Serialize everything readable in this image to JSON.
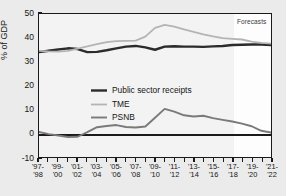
{
  "chart_data": {
    "type": "line",
    "title": "",
    "xlabel": "",
    "ylabel": "% of GDP",
    "ylim": [
      -10,
      50
    ],
    "yticks": [
      -10,
      0,
      10,
      20,
      30,
      40,
      50
    ],
    "grid": false,
    "legend_position": "inside-left",
    "categories": [
      "'97-'98",
      "'98-'99",
      "'99-'00",
      "'00-'01",
      "'01-'02",
      "'02-'03",
      "'03-'04",
      "'04-'05",
      "'05-'06",
      "'06-'07",
      "'07-'08",
      "'08-'09",
      "'09-'10",
      "'10-'11",
      "'11-'12",
      "'12-'13",
      "'13-'14",
      "'14-'15",
      "'15-'16",
      "'16-'17",
      "'17-'18",
      "'18-'19",
      "'19-'20",
      "'20-'21",
      "'21-'22"
    ],
    "x_tick_labels": [
      {
        "top": "'97-",
        "bottom": "'98"
      },
      {
        "top": "'99-",
        "bottom": "'00"
      },
      {
        "top": "'01-",
        "bottom": "'02"
      },
      {
        "top": "'03-",
        "bottom": "'04"
      },
      {
        "top": "'05-",
        "bottom": "'06"
      },
      {
        "top": "'07-",
        "bottom": "'08"
      },
      {
        "top": "'09-",
        "bottom": "'10"
      },
      {
        "top": "'11-",
        "bottom": "'12"
      },
      {
        "top": "'13-",
        "bottom": "'14"
      },
      {
        "top": "'15-",
        "bottom": "'16"
      },
      {
        "top": "'17-",
        "bottom": "'18"
      },
      {
        "top": "'19-",
        "bottom": "'20"
      },
      {
        "top": "'21-",
        "bottom": "'22"
      }
    ],
    "series": [
      {
        "name": "Public sector receipts",
        "color": "#2b2b2b",
        "width": 2.4,
        "values": [
          34.0,
          34.6,
          35.1,
          35.6,
          35.3,
          34.0,
          34.1,
          34.8,
          35.6,
          36.3,
          36.6,
          36.0,
          35.0,
          36.3,
          36.5,
          36.3,
          36.3,
          36.2,
          36.4,
          36.6,
          37.0,
          37.1,
          37.2,
          37.2,
          37.0
        ]
      },
      {
        "name": "TME",
        "color": "#b4b4b4",
        "width": 1.8,
        "values": [
          34.5,
          34.3,
          34.2,
          34.5,
          35.5,
          36.4,
          37.4,
          38.2,
          38.6,
          38.7,
          38.8,
          40.5,
          44.2,
          45.4,
          44.7,
          43.6,
          42.5,
          41.5,
          40.6,
          39.9,
          39.6,
          39.3,
          38.4,
          37.9,
          37.6
        ]
      },
      {
        "name": "PSNB",
        "color": "#7a7a7a",
        "width": 1.9,
        "values": [
          0.5,
          -0.4,
          -1.0,
          -1.6,
          -1.5,
          0.4,
          2.5,
          3.0,
          3.4,
          2.6,
          2.4,
          2.8,
          6.5,
          10.2,
          9.0,
          7.5,
          7.0,
          7.3,
          6.3,
          5.6,
          4.9,
          4.0,
          2.9,
          1.0,
          0.3
        ]
      }
    ],
    "forecast": {
      "label": "Forecasts",
      "start_category": "'17-'18",
      "start_index": 20
    }
  }
}
